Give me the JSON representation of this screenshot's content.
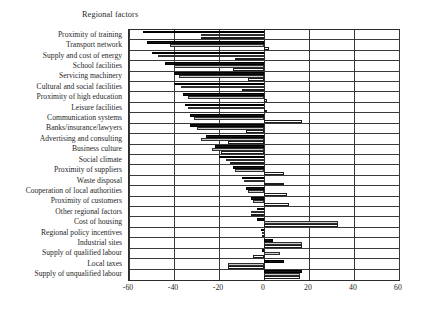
{
  "chart_data": {
    "type": "bar",
    "orientation": "horizontal",
    "title": "Regional factors",
    "xlabel": "",
    "ylabel": "",
    "xlim": [
      -60,
      60
    ],
    "xticks": [
      -60,
      -40,
      -20,
      0,
      20,
      40,
      60
    ],
    "xticklabels": [
      "-60",
      "-40",
      "-20",
      "0",
      "20",
      "40",
      "60"
    ],
    "grid": true,
    "grid_axis": "x",
    "legend": "none",
    "series_styles": [
      "solid-black",
      "grey-hatched",
      "white-outline"
    ],
    "categories": [
      "Proximity of training",
      "Transport network",
      "Supply and cost of energy",
      "School facilities",
      "Servicing machinery",
      "Cultural and social facilities",
      "Proximity of high education",
      "Leisure facilities",
      "Communication systems",
      "Banks/insurance/lawyers",
      "Advertising and consulting",
      "Business culture",
      "Social climate",
      "Proximity of suppliers",
      "Waste disposal",
      "Cooperation of local authorities",
      "Proximity of customers",
      "Other regional factors",
      "Cost of housing",
      "Regional policy incentives",
      "Industrial sites",
      "Supply of qualified labour",
      "Local taxes",
      "Supply of unqualified labour"
    ],
    "series": [
      {
        "name": "Series 1",
        "style": "solid-black",
        "values": [
          -54,
          -52,
          -50,
          -44,
          -40,
          -40,
          -36,
          -35,
          -33,
          -33,
          -26,
          -22,
          -20,
          -14,
          -10,
          -8,
          -6,
          -3,
          -3,
          -1.5,
          4,
          -1,
          9,
          17
        ]
      },
      {
        "name": "Series 2",
        "style": "grey-hatched",
        "values": [
          -28,
          -42,
          -47,
          -40,
          -38,
          -37,
          -34,
          -34,
          -31,
          -30,
          -28,
          -23,
          -17,
          -13,
          -9,
          -7,
          -5,
          -6,
          33,
          -1,
          17,
          7,
          -16,
          16
        ]
      },
      {
        "name": "Series 3",
        "style": "white-outline",
        "values": [
          -28,
          2,
          -13,
          -14,
          -7,
          -10,
          1.5,
          1.5,
          17,
          -8,
          -16,
          -19,
          -15,
          9,
          9,
          10,
          11,
          -6,
          33,
          -1,
          17,
          -5,
          -16,
          16
        ]
      }
    ]
  }
}
